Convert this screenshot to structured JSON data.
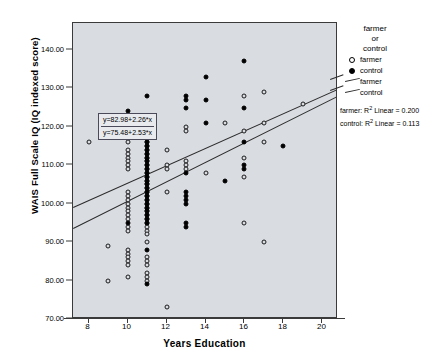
{
  "chart_data": {
    "type": "scatter",
    "title": "",
    "xlabel": "Years Education",
    "ylabel": "WAIS Full Scale IQ (IQ indexed score)",
    "xlim": [
      7.2,
      20.8
    ],
    "ylim": [
      70.0,
      147.0
    ],
    "xticks": [
      8,
      10,
      12,
      14,
      16,
      18,
      20
    ],
    "xtick_labels": [
      "8",
      "10",
      "12",
      "14",
      "16",
      "18",
      "20"
    ],
    "yticks": [
      70,
      80,
      90,
      100,
      110,
      120,
      130,
      140
    ],
    "ytick_labels": [
      "70.00",
      "80.00",
      "90.00",
      "100.00",
      "110.00",
      "120.00",
      "130.00",
      "140.00"
    ],
    "grid": false,
    "legend_position": "right",
    "plot_background": "#d9dce1",
    "series": [
      {
        "name": "farmer",
        "marker": "open-circle",
        "color": "#000000",
        "points": [
          [
            8,
            116
          ],
          [
            9,
            89
          ],
          [
            9,
            80
          ],
          [
            10,
            122
          ],
          [
            10,
            120
          ],
          [
            10,
            118
          ],
          [
            10,
            116
          ],
          [
            10,
            114
          ],
          [
            10,
            113
          ],
          [
            10,
            112
          ],
          [
            10,
            111
          ],
          [
            10,
            110
          ],
          [
            10,
            109
          ],
          [
            10,
            103
          ],
          [
            10,
            102
          ],
          [
            10,
            101
          ],
          [
            10,
            100
          ],
          [
            10,
            99
          ],
          [
            10,
            98
          ],
          [
            10,
            97
          ],
          [
            10,
            96
          ],
          [
            10,
            94
          ],
          [
            10,
            93
          ],
          [
            10,
            88
          ],
          [
            10,
            87
          ],
          [
            10,
            86
          ],
          [
            10,
            85
          ],
          [
            10,
            84
          ],
          [
            10,
            81
          ],
          [
            11,
            121
          ],
          [
            11,
            119
          ],
          [
            11,
            118
          ],
          [
            11,
            117
          ],
          [
            11,
            116
          ],
          [
            11,
            115
          ],
          [
            11,
            114
          ],
          [
            11,
            113
          ],
          [
            11,
            112
          ],
          [
            11,
            111
          ],
          [
            11,
            110
          ],
          [
            11,
            109
          ],
          [
            11,
            108
          ],
          [
            11,
            107
          ],
          [
            11,
            106
          ],
          [
            11,
            105
          ],
          [
            11,
            104
          ],
          [
            11,
            103
          ],
          [
            11,
            102
          ],
          [
            11,
            101
          ],
          [
            11,
            100
          ],
          [
            11,
            99
          ],
          [
            11,
            98
          ],
          [
            11,
            97
          ],
          [
            11,
            96
          ],
          [
            11,
            95
          ],
          [
            11,
            94
          ],
          [
            11,
            93
          ],
          [
            11,
            92
          ],
          [
            11,
            90
          ],
          [
            11,
            86
          ],
          [
            11,
            85
          ],
          [
            11,
            84
          ],
          [
            11,
            82
          ],
          [
            11,
            81
          ],
          [
            11,
            80
          ],
          [
            12,
            114
          ],
          [
            12,
            110
          ],
          [
            12,
            109
          ],
          [
            12,
            103
          ],
          [
            12,
            73
          ],
          [
            13,
            120
          ],
          [
            13,
            119
          ],
          [
            13,
            111
          ],
          [
            13,
            110
          ],
          [
            13,
            109
          ],
          [
            14,
            108
          ],
          [
            15,
            121
          ],
          [
            16,
            128
          ],
          [
            16,
            119
          ],
          [
            16,
            112
          ],
          [
            16,
            107
          ],
          [
            16,
            95
          ],
          [
            17,
            129
          ],
          [
            17,
            121
          ],
          [
            17,
            116
          ],
          [
            17,
            90
          ],
          [
            19,
            126
          ]
        ]
      },
      {
        "name": "control",
        "marker": "filled-circle",
        "color": "#000000",
        "points": [
          [
            10,
            124
          ],
          [
            10,
            95
          ],
          [
            11,
            128
          ],
          [
            11,
            121
          ],
          [
            11,
            117
          ],
          [
            11,
            116
          ],
          [
            11,
            115
          ],
          [
            11,
            114
          ],
          [
            11,
            113
          ],
          [
            11,
            112
          ],
          [
            11,
            111
          ],
          [
            11,
            110
          ],
          [
            11,
            109
          ],
          [
            11,
            108
          ],
          [
            11,
            107
          ],
          [
            11,
            106
          ],
          [
            11,
            105
          ],
          [
            11,
            104
          ],
          [
            11,
            103
          ],
          [
            11,
            102
          ],
          [
            11,
            101
          ],
          [
            11,
            100
          ],
          [
            11,
            99
          ],
          [
            11,
            98
          ],
          [
            11,
            97
          ],
          [
            11,
            96
          ],
          [
            11,
            95
          ],
          [
            11,
            88
          ],
          [
            11,
            79
          ],
          [
            13,
            128
          ],
          [
            13,
            127
          ],
          [
            13,
            125
          ],
          [
            13,
            108
          ],
          [
            13,
            103
          ],
          [
            13,
            102
          ],
          [
            13,
            101
          ],
          [
            13,
            100
          ],
          [
            13,
            95
          ],
          [
            13,
            94
          ],
          [
            14,
            133
          ],
          [
            14,
            127
          ],
          [
            14,
            121
          ],
          [
            15,
            106
          ],
          [
            16,
            137
          ],
          [
            16,
            125
          ],
          [
            16,
            116
          ],
          [
            16,
            110
          ],
          [
            16,
            109
          ],
          [
            18,
            115
          ]
        ]
      }
    ],
    "fit_lines": [
      {
        "name": "farmer",
        "equation": "y=82.98+2.26*x",
        "intercept": 82.98,
        "slope": 2.26,
        "r2_label": "farmer: R2 Linear = 0.200",
        "r2": 0.2
      },
      {
        "name": "control",
        "equation": "y=75.48+2.53*x",
        "intercept": 75.48,
        "slope": 2.53,
        "r2_label": "control: R2 Linear = 0.113",
        "r2": 0.113
      }
    ]
  },
  "legend": {
    "title_line1": "farmer",
    "title_line2": "or",
    "title_line3": "control",
    "entries": [
      {
        "label": "farmer",
        "marker": "open-circle"
      },
      {
        "label": "control",
        "marker": "filled-circle"
      },
      {
        "label": "farmer",
        "marker": "line"
      },
      {
        "label": "control",
        "marker": "line"
      }
    ],
    "r2_lines": [
      {
        "prefix": "farmer: R",
        "sup": "2",
        "suffix": " Linear = 0.200"
      },
      {
        "prefix": "control: R",
        "sup": "2",
        "suffix": " Linear = 0.113"
      }
    ]
  },
  "equation_box": {
    "line1": "y=82.98+2.26*x",
    "line2": "y=75.48+2.53*x"
  }
}
